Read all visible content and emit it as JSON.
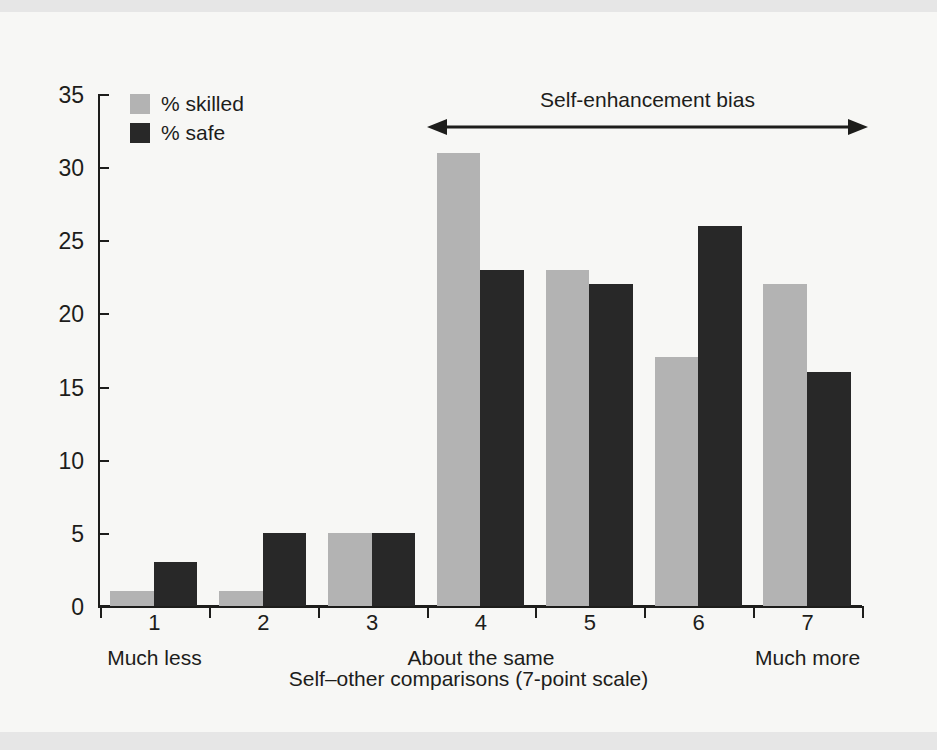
{
  "chart_data": {
    "type": "bar",
    "title": "",
    "categories": [
      "1",
      "2",
      "3",
      "4",
      "5",
      "6",
      "7"
    ],
    "series": [
      {
        "name": "% skilled",
        "color": "#b3b3b3",
        "values": [
          1,
          1,
          5,
          31,
          23,
          17,
          22
        ]
      },
      {
        "name": "% safe",
        "color": "#282828",
        "values": [
          3,
          5,
          5,
          23,
          22,
          26,
          16
        ]
      }
    ],
    "xlabel": "Self–other comparisons (7-point scale)",
    "ylabel": "",
    "ylim": [
      0,
      35
    ],
    "yticks": [
      "0",
      "5",
      "10",
      "15",
      "20",
      "25",
      "30",
      "35"
    ],
    "grid": false,
    "legend_position": "top-left",
    "anchors": [
      {
        "category": "1",
        "text": "Much less"
      },
      {
        "category": "4",
        "text": "About the same"
      },
      {
        "category": "7",
        "text": "Much more"
      }
    ],
    "annotations": [
      {
        "text": "Self-enhancement bias",
        "type": "double-arrow",
        "span": [
          "4",
          "7"
        ]
      }
    ]
  },
  "legend": {
    "items": [
      {
        "label": "% skilled",
        "swatch": "legend-swatch-skilled"
      },
      {
        "label": "% safe",
        "swatch": "legend-swatch-safe"
      }
    ]
  },
  "figure": {
    "xaxis_title": "Self–other comparisons (7-point scale)",
    "annotation_text": "Self-enhancement bias"
  }
}
